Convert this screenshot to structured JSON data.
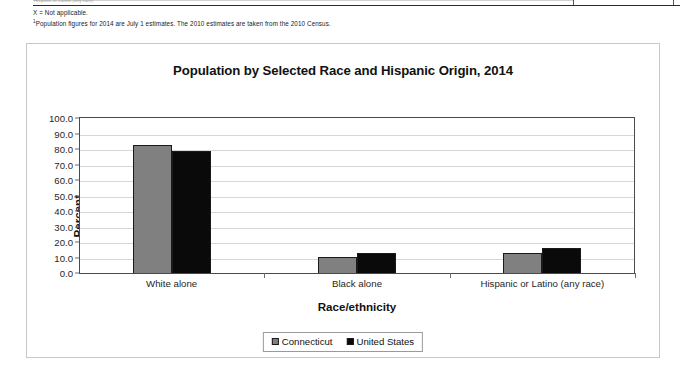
{
  "table_remnant": {
    "truncated_row_text": "Hispanic or Latino (any race)",
    "column_divider_count": 4
  },
  "footnotes": {
    "not_applicable": "X = Not applicable.",
    "population_marker": "1",
    "population_note": "Population figures for 2014 are July 1 estimates. The 2010 estimates are taken from the 2010 Census."
  },
  "colors": {
    "series_connecticut": "#808080",
    "series_united_states": "#0a0a0a",
    "gridline": "#d6d6d6",
    "axis": "#4a4a4a",
    "frame_border": "#c8c8c8"
  },
  "legend": {
    "position": "bottom-center",
    "items": [
      {
        "label": "Connecticut",
        "swatch": "series-ct"
      },
      {
        "label": "United States",
        "swatch": "series-us"
      }
    ]
  },
  "chart_data": {
    "type": "bar",
    "title": "Population by Selected Race and Hispanic Origin, 2014",
    "xlabel": "Race/ethnicity",
    "ylabel": "Percent",
    "ylim": [
      0,
      100
    ],
    "ytick_step": 10,
    "ytick_labels": [
      "0.0",
      "10.0",
      "20.0",
      "30.0",
      "40.0",
      "50.0",
      "60.0",
      "70.0",
      "80.0",
      "90.0",
      "100.0"
    ],
    "grid": true,
    "grid_axis": "y",
    "legend_position": "bottom-center",
    "categories": [
      "White alone",
      "Black alone",
      "Hispanic or Latino (any race)"
    ],
    "series": [
      {
        "name": "Connecticut",
        "values": [
          82.6,
          10.3,
          12.9
        ]
      },
      {
        "name": "United States",
        "values": [
          78.7,
          12.9,
          16.1
        ]
      }
    ]
  }
}
